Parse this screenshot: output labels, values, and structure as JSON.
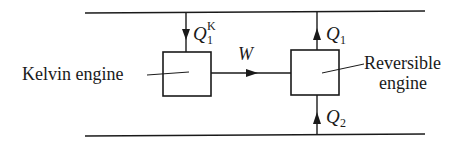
{
  "diagram": {
    "reservoirs": {
      "hot": {
        "name": "hot-reservoir-line"
      },
      "cold": {
        "name": "cold-reservoir-line"
      }
    },
    "engines": {
      "kelvin": {
        "label": "Kelvin engine"
      },
      "reversible": {
        "label_line1": "Reversible",
        "label_line2": "engine"
      }
    },
    "flows": {
      "q1k": {
        "symbol": "Q",
        "sub": "1",
        "sup": "K"
      },
      "w": {
        "symbol": "W"
      },
      "q1": {
        "symbol": "Q",
        "sub": "1"
      },
      "q2": {
        "symbol": "Q",
        "sub": "2"
      }
    }
  },
  "colors": {
    "ink": "#1a1a1a",
    "background": "#ffffff"
  }
}
